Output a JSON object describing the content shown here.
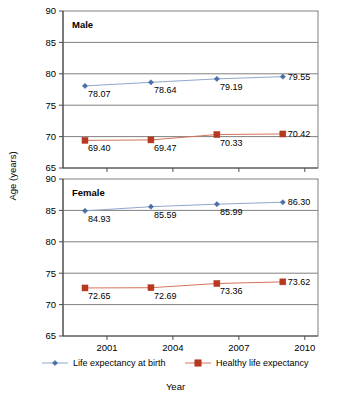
{
  "chart_data": {
    "type": "line",
    "title": "",
    "xlabel": "Year",
    "ylabel": "Age (years)",
    "xlim": [
      1999,
      2010.6
    ],
    "ylim": [
      65,
      90
    ],
    "x_ticks": [
      2001,
      2004,
      2007,
      2010
    ],
    "y_ticks": [
      65,
      70,
      75,
      80,
      85,
      90
    ],
    "grid": true,
    "legend_position": "bottom",
    "x": [
      2000,
      2003,
      2006,
      2009
    ],
    "panels": [
      {
        "name": "Male",
        "series": [
          {
            "name": "Life expectancy at birth",
            "color": "#4a6fa5",
            "marker": "diamond",
            "values": [
              78.07,
              78.64,
              79.19,
              79.55
            ],
            "labels": [
              "78.07",
              "78.64",
              "79.19",
              "79.55"
            ]
          },
          {
            "name": "Healthy life expectancy",
            "color": "#b5381f",
            "marker": "square",
            "values": [
              69.4,
              69.47,
              70.33,
              70.42
            ],
            "labels": [
              "69.40",
              "69.47",
              "70.33",
              "70.42"
            ]
          }
        ]
      },
      {
        "name": "Female",
        "series": [
          {
            "name": "Life expectancy at birth",
            "color": "#4a6fa5",
            "marker": "diamond",
            "values": [
              84.93,
              85.59,
              85.99,
              86.3
            ],
            "labels": [
              "84.93",
              "85.59",
              "85.99",
              "86.30"
            ]
          },
          {
            "name": "Healthy life expectancy",
            "color": "#b5381f",
            "marker": "square",
            "values": [
              72.65,
              72.69,
              73.36,
              73.62
            ],
            "labels": [
              "72.65",
              "72.69",
              "73.36",
              "73.62"
            ]
          }
        ]
      }
    ],
    "legend": [
      {
        "label": "Life expectancy at birth",
        "color": "#4a6fa5",
        "marker": "diamond"
      },
      {
        "label": "Healthy life expectancy",
        "color": "#b5381f",
        "marker": "square"
      }
    ]
  }
}
